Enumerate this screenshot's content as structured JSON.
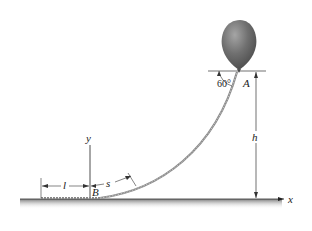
{
  "diagram": {
    "type": "physics-figure",
    "labels": {
      "point_a": "A",
      "point_b": "B",
      "angle": "60°",
      "height": "h",
      "length_l": "l",
      "arc_s": "s",
      "axis_x": "x",
      "axis_y": "y"
    },
    "colors": {
      "balloon": "#6e6e6e",
      "balloon_highlight": "#9a9a9a",
      "rope": "#8c8c8c",
      "lines": "#222222",
      "ground_shadow": "#9a9a9a"
    }
  }
}
